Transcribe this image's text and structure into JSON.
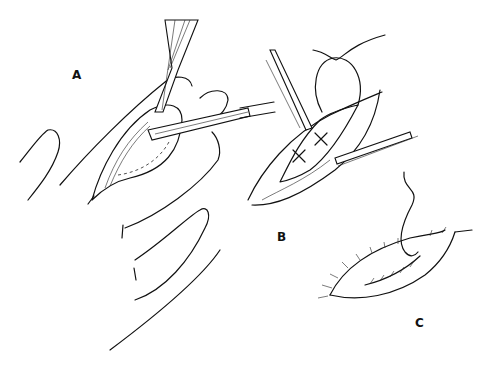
{
  "figure": {
    "panels": [
      {
        "id": "A",
        "label": "A",
        "content": "Fingers with opened lesion; forceps and probe retracting tissue flap, dashed incision line"
      },
      {
        "id": "B",
        "label": "B",
        "content": "Two retractors holding wound open; interrupted deep sutures (X-shaped) placed, suture loop with needle above"
      },
      {
        "id": "C",
        "label": "C",
        "content": "Closed wound with running suture line along incision, thread trailing upward"
      }
    ]
  }
}
